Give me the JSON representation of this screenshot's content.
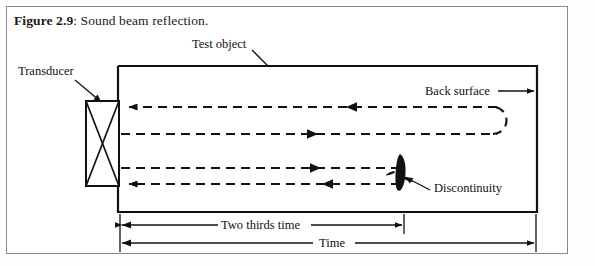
{
  "figure": {
    "caption_label": "Figure 2.9",
    "caption_text": ": Sound beam reflection.",
    "caption_full": "Figure 2.9: Sound beam reflection."
  },
  "labels": {
    "transducer": "Transducer",
    "test_object": "Test object",
    "back_surface": "Back surface",
    "discontinuity": "Discontinuity"
  },
  "dimensions": {
    "two_thirds_time": "Two thirds time",
    "time": "Time"
  },
  "colors": {
    "ink": "#111111",
    "frame": "#8a8a8a",
    "background": "#ffffff"
  },
  "beam_paths": [
    {
      "id": "row-1",
      "direction": "left",
      "y": 107,
      "note": "back-surface echo returning to transducer"
    },
    {
      "id": "row-2",
      "direction": "right",
      "y": 134,
      "note": "outgoing beam to back surface"
    },
    {
      "id": "row-3",
      "direction": "right",
      "y": 168,
      "note": "outgoing beam to discontinuity"
    },
    {
      "id": "row-4",
      "direction": "left",
      "y": 184,
      "note": "discontinuity echo returning to transducer"
    }
  ]
}
